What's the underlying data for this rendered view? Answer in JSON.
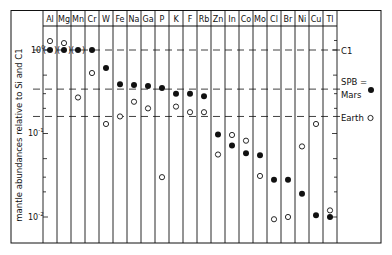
{
  "chart_data": {
    "type": "scatter",
    "title": "",
    "xlabel": "",
    "ylabel": "mantle abundances relative to Si and C1",
    "yscale": "log",
    "ylim": [
      0.0055,
      1.6
    ],
    "y_ticks": [
      {
        "value": 1,
        "label": "10⁰"
      },
      {
        "value": 0.1,
        "label": "10⁻¹"
      },
      {
        "value": 0.01,
        "label": "10⁻²"
      }
    ],
    "categories": [
      "Al",
      "Mg",
      "Mn",
      "Cr",
      "W",
      "Fe",
      "Na",
      "Ga",
      "P",
      "K",
      "F",
      "Rb",
      "Zn",
      "In",
      "Co",
      "Mo",
      "Cl",
      "Br",
      "Ni",
      "Cu",
      "Tl"
    ],
    "series": [
      {
        "name": "SPB = Mars",
        "marker": "filled-circle",
        "values": [
          1.0,
          1.0,
          1.0,
          1.0,
          0.61,
          0.39,
          0.38,
          0.37,
          0.35,
          0.3,
          0.3,
          0.28,
          0.097,
          0.072,
          0.058,
          0.055,
          0.028,
          0.028,
          0.019,
          0.0105,
          0.01
        ],
        "parenthesized": [
          "Al",
          "Mg",
          "Mn"
        ]
      },
      {
        "name": "Earth",
        "marker": "open-circle",
        "values": [
          1.28,
          1.21,
          0.27,
          0.53,
          0.13,
          0.16,
          0.24,
          0.2,
          0.03,
          0.21,
          0.18,
          0.18,
          0.056,
          0.096,
          0.082,
          0.031,
          0.0094,
          0.01,
          0.07,
          0.13,
          0.012
        ]
      }
    ],
    "reference_lines": [
      {
        "label": "C1",
        "value": 1.0,
        "style": "dashed"
      },
      {
        "label": "",
        "value": 0.34,
        "style": "dashed"
      },
      {
        "label": "",
        "value": 0.16,
        "style": "dashed"
      }
    ],
    "legend": {
      "position": "right",
      "entries": [
        {
          "label_lines": [
            "SPB =",
            "Mars"
          ],
          "marker": "filled-circle"
        },
        {
          "label_lines": [
            "Earth"
          ],
          "marker": "open-circle"
        }
      ]
    },
    "grid": {
      "vertical_column_lines": true,
      "horizontal": false
    }
  },
  "labels": {
    "ylabel": "mantle abundances relative to Si and C1",
    "c1": "C1",
    "spb_line1": "SPB =",
    "spb_line2": "Mars",
    "earth": "Earth",
    "tick_0": "10",
    "tick_0_exp": "0",
    "tick_1": "10",
    "tick_1_exp": "-1",
    "tick_2": "10",
    "tick_2_exp": "-2"
  },
  "colors": {
    "ink": "#111111",
    "background": "#ffffff"
  }
}
